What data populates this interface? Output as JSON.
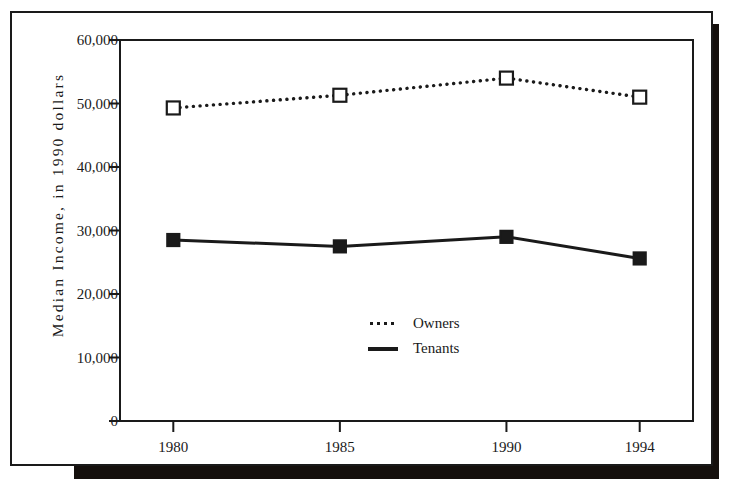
{
  "chart_data": {
    "type": "line",
    "title": "",
    "xlabel": "",
    "ylabel": "Median Income, in 1990 dollars",
    "categories": [
      "1980",
      "1985",
      "1990",
      "1994"
    ],
    "x": [
      1980,
      1985,
      1990,
      1994
    ],
    "xlim": [
      1978.4,
      1995.6
    ],
    "ylim": [
      0,
      60000
    ],
    "grid": false,
    "legend_position": "center",
    "y_ticks": [
      "0",
      "10,000",
      "20,000",
      "30,000",
      "40,000",
      "50,000",
      "60,000"
    ],
    "y_tick_values": [
      0,
      10000,
      20000,
      30000,
      40000,
      50000,
      60000
    ],
    "x_ticks": [
      "1980",
      "1985",
      "1990",
      "1994"
    ],
    "series": [
      {
        "name": "Owners",
        "values": [
          49300,
          51300,
          54000,
          51000
        ],
        "line_style": "dotted",
        "marker": "open-square",
        "color": "#1a1a1a"
      },
      {
        "name": "Tenants",
        "values": [
          28500,
          27500,
          29000,
          25600
        ],
        "line_style": "solid",
        "marker": "filled-square",
        "color": "#1a1a1a"
      }
    ]
  },
  "legend": {
    "items": [
      {
        "label": "Owners",
        "key": "dotted-line-key"
      },
      {
        "label": "Tenants",
        "key": "solid-line-key"
      }
    ]
  },
  "colors": {
    "ink": "#1a1a1a",
    "paper": "#ffffff",
    "shadow": "#15100d"
  }
}
